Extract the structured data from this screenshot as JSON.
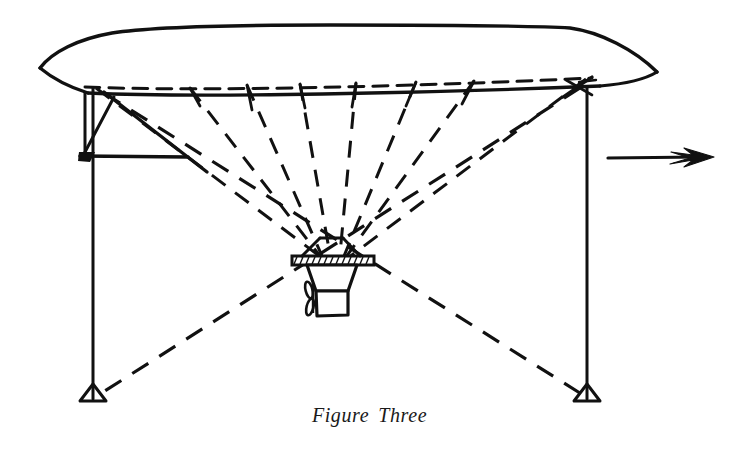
{
  "figure": {
    "caption_word_1": "Figure",
    "caption_word_2": "Three",
    "caption": "Figure Three",
    "line_color": "#111111",
    "background_color": "#ffffff",
    "width": 739,
    "height": 453
  },
  "elements": {
    "envelope_label": "airship envelope",
    "near_keel_label": "near lower longitudinal edge",
    "far_keel_label": "far lower longitudinal edge (hidden, dashed)",
    "left_mast_label": "left mooring mast",
    "right_mast_label": "right mooring mast",
    "left_mast_bracket_label": "left mast cross bracing",
    "gondola_label": "control car / gondola",
    "propeller_label": "propeller",
    "suspension_label": "suspension cable fan",
    "guy_wire_label": "guy wires to mast bases",
    "left_mast_base_label": "left mast footing",
    "right_mast_base_label": "right mast footing",
    "arrow_label": "direction of travel arrow"
  },
  "geometry": {
    "envelope_nose_left": [
      40,
      68
    ],
    "envelope_nose_right": [
      657,
      72
    ],
    "envelope_top_left_shoulder": [
      120,
      33
    ],
    "envelope_top_right_shoulder": [
      575,
      26
    ],
    "near_keel_left": [
      88,
      93
    ],
    "near_keel_right": [
      600,
      86
    ],
    "far_keel_left": [
      85,
      87
    ],
    "far_keel_right": [
      592,
      78
    ],
    "left_mast_top": [
      93,
      88
    ],
    "left_mast_bottom": [
      93,
      399
    ],
    "right_mast_top": [
      587,
      88
    ],
    "right_mast_bottom": [
      587,
      399
    ],
    "gondola_center": [
      331,
      262
    ],
    "arrow_start": [
      608,
      159
    ],
    "arrow_end": [
      713,
      157
    ]
  },
  "cables": {
    "count": 8,
    "attachment_x": [
      95,
      190,
      245,
      300,
      355,
      415,
      472,
      585
    ],
    "converge_at": [
      331,
      260
    ]
  }
}
